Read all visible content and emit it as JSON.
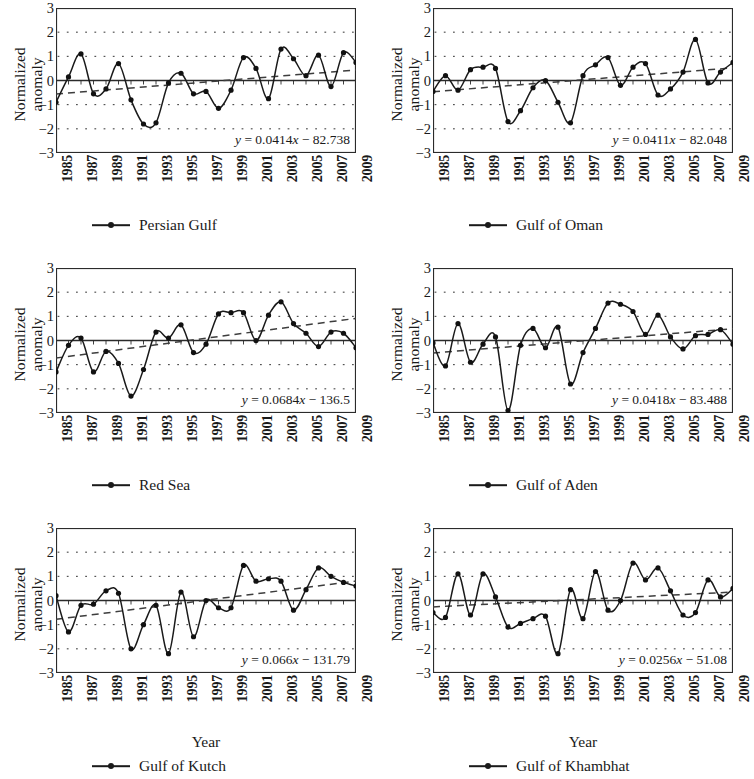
{
  "figure": {
    "y_axis_title": "Normalized anomaly",
    "x_axis_title": "Year",
    "y_ticks": [
      "3",
      "2",
      "1",
      "0",
      "−1",
      "−2",
      "−3"
    ],
    "x_ticks": [
      "1985",
      "1987",
      "1989",
      "1991",
      "1993",
      "1995",
      "1997",
      "1999",
      "2001",
      "2003",
      "2005",
      "2007",
      "2009"
    ],
    "series_color": "#1a1a1a",
    "trend_color": "#4a4a4a"
  },
  "chart_data": [
    {
      "type": "line",
      "title": "Persian Gulf",
      "legend_label": "Persian Gulf",
      "xlabel": "",
      "ylabel": "Normalized anomaly",
      "ylim": [
        -3,
        3
      ],
      "xlim": [
        1985,
        2009
      ],
      "grid": true,
      "annotation": "y = 0.0414x − 82.738",
      "trend": {
        "slope": 0.0414,
        "intercept": -82.738
      },
      "x": [
        1985,
        1986,
        1987,
        1988,
        1989,
        1990,
        1991,
        1992,
        1993,
        1994,
        1995,
        1996,
        1997,
        1998,
        1999,
        2000,
        2001,
        2002,
        2003,
        2004,
        2005,
        2006,
        2007,
        2008,
        2009
      ],
      "values": [
        -0.9,
        0.15,
        1.1,
        -0.55,
        -0.35,
        0.7,
        -0.8,
        -1.8,
        -1.75,
        -0.1,
        0.3,
        -0.55,
        -0.45,
        -1.15,
        -0.4,
        0.95,
        0.5,
        -0.75,
        1.3,
        0.9,
        0.2,
        1.05,
        -0.25,
        1.15,
        0.75,
        0.6,
        -0.9,
        0.35
      ]
    },
    {
      "type": "line",
      "title": "Gulf of Oman",
      "legend_label": "Gulf of Oman",
      "xlabel": "",
      "ylabel": "Normalized anomaly",
      "ylim": [
        -3,
        3
      ],
      "xlim": [
        1985,
        2009
      ],
      "grid": true,
      "annotation": "y = 0.0411x − 82.048",
      "trend": {
        "slope": 0.0411,
        "intercept": -82.048
      },
      "x": [
        1985,
        1986,
        1987,
        1988,
        1989,
        1990,
        1991,
        1992,
        1993,
        1994,
        1995,
        1996,
        1997,
        1998,
        1999,
        2000,
        2001,
        2002,
        2003,
        2004,
        2005,
        2006,
        2007,
        2008,
        2009
      ],
      "values": [
        -0.45,
        0.2,
        -0.4,
        0.45,
        0.55,
        0.5,
        -1.7,
        -1.25,
        -0.3,
        0.0,
        -0.9,
        -1.75,
        0.2,
        0.65,
        0.95,
        -0.2,
        0.55,
        0.7,
        -0.6,
        -0.35,
        0.35,
        1.7,
        -0.1,
        0.35,
        0.75
      ]
    },
    {
      "type": "line",
      "title": "Red Sea",
      "legend_label": "Red Sea",
      "xlabel": "",
      "ylabel": "Normalized anomaly",
      "ylim": [
        -3,
        3
      ],
      "xlim": [
        1985,
        2009
      ],
      "grid": true,
      "annotation": "y = 0.0684x − 136.5",
      "trend": {
        "slope": 0.0684,
        "intercept": -136.5
      },
      "x": [
        1985,
        1986,
        1987,
        1988,
        1989,
        1990,
        1991,
        1992,
        1993,
        1994,
        1995,
        1996,
        1997,
        1998,
        1999,
        2000,
        2001,
        2002,
        2003,
        2004,
        2005,
        2006,
        2007,
        2008,
        2009
      ],
      "values": [
        -1.3,
        -0.2,
        0.1,
        -1.3,
        -0.45,
        -0.95,
        -2.3,
        -1.2,
        0.35,
        0.1,
        0.65,
        -0.5,
        -0.15,
        1.1,
        1.15,
        1.15,
        0.0,
        1.05,
        1.6,
        0.7,
        0.3,
        -0.25,
        0.35,
        0.3,
        -0.3,
        0.8
      ]
    },
    {
      "type": "line",
      "title": "Gulf of Aden",
      "legend_label": "Gulf of Aden",
      "xlabel": "",
      "ylabel": "Normalized anomaly",
      "ylim": [
        -3,
        3
      ],
      "xlim": [
        1985,
        2009
      ],
      "grid": true,
      "annotation": "y = 0.0418x − 83.488",
      "trend": {
        "slope": 0.0418,
        "intercept": -83.488
      },
      "x": [
        1985,
        1986,
        1987,
        1988,
        1989,
        1990,
        1991,
        1992,
        1993,
        1994,
        1995,
        1996,
        1997,
        1998,
        1999,
        2000,
        2001,
        2002,
        2003,
        2004,
        2005,
        2006,
        2007,
        2008,
        2009
      ],
      "values": [
        -0.1,
        -1.05,
        0.7,
        -0.9,
        -0.15,
        0.15,
        -2.9,
        -0.2,
        0.5,
        -0.3,
        0.55,
        -1.8,
        -0.5,
        0.5,
        1.55,
        1.5,
        1.2,
        0.25,
        1.05,
        0.15,
        -0.35,
        0.2,
        0.25,
        0.45,
        -0.15,
        -0.35,
        0.4
      ]
    },
    {
      "type": "line",
      "title": "Gulf of Kutch",
      "legend_label": "Gulf of Kutch",
      "xlabel": "Year",
      "ylabel": "Normalized anomaly",
      "ylim": [
        -3,
        3
      ],
      "xlim": [
        1985,
        2009
      ],
      "grid": true,
      "annotation": "y = 0.066x − 131.79",
      "trend": {
        "slope": 0.066,
        "intercept": -131.79
      },
      "x": [
        1985,
        1986,
        1987,
        1988,
        1989,
        1990,
        1991,
        1992,
        1993,
        1994,
        1995,
        1996,
        1997,
        1998,
        1999,
        2000,
        2001,
        2002,
        2003,
        2004,
        2005,
        2006,
        2007,
        2008,
        2009
      ],
      "values": [
        0.2,
        -1.3,
        -0.2,
        -0.15,
        0.4,
        0.3,
        -2.0,
        -1.0,
        -0.2,
        -2.2,
        0.35,
        -1.5,
        0.0,
        -0.3,
        -0.3,
        1.45,
        0.8,
        0.9,
        0.8,
        -0.4,
        0.45,
        1.35,
        1.0,
        0.75,
        0.6
      ]
    },
    {
      "type": "line",
      "title": "Gulf of Khambhat",
      "legend_label": "Gulf of Khambhat",
      "xlabel": "Year",
      "ylabel": "Normalized anomaly",
      "ylim": [
        -3,
        3
      ],
      "xlim": [
        1985,
        2009
      ],
      "grid": true,
      "annotation": "y = 0.0256x − 51.08",
      "trend": {
        "slope": 0.0256,
        "intercept": -51.08
      },
      "x": [
        1985,
        1986,
        1987,
        1988,
        1989,
        1990,
        1991,
        1992,
        1993,
        1994,
        1995,
        1996,
        1997,
        1998,
        1999,
        2000,
        2001,
        2002,
        2003,
        2004,
        2005,
        2006,
        2007,
        2008,
        2009
      ],
      "values": [
        -0.5,
        -0.7,
        1.1,
        -0.6,
        1.1,
        0.15,
        -1.1,
        -0.95,
        -0.75,
        -0.65,
        -2.2,
        0.45,
        -0.75,
        1.2,
        -0.4,
        0.0,
        1.55,
        0.85,
        1.35,
        0.4,
        -0.6,
        -0.5,
        0.85,
        0.15,
        0.5,
        -0.7
      ]
    }
  ]
}
